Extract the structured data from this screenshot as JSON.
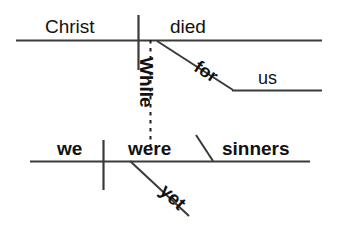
{
  "diagram": {
    "type": "reed-kellogg-sentence-diagram",
    "sentence": "While we were yet sinners Christ died for us",
    "stroke_color": "#3a3a3a",
    "text_color": "#111111",
    "background_color": "#ffffff",
    "main_clause": {
      "subject": "Christ",
      "verb": "died",
      "modifier_phrase": {
        "preposition": "for",
        "object": "us"
      }
    },
    "subordinate_clause": {
      "conjunction": "While",
      "subject": "we",
      "verb": "were",
      "adverb": "yet",
      "complement": "sinners"
    }
  }
}
